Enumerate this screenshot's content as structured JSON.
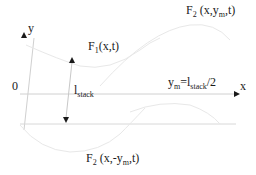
{
  "diagram": {
    "axes": {
      "x_label": "x",
      "y_label": "y",
      "origin_label": "0"
    },
    "curves": [
      {
        "id": "F1",
        "label_main": "F",
        "label_sub": "1",
        "label_args": "(x,t)"
      },
      {
        "id": "F2_upper",
        "label_main": "F",
        "label_sub": "2",
        "label_args_pre": " (x,y",
        "label_args_sub": "m",
        "label_args_post": ",t)"
      },
      {
        "id": "F2_lower",
        "label_main": "F",
        "label_sub": "2",
        "label_args_pre": " (x,-y",
        "label_args_sub": "m",
        "label_args_post": ",t)"
      }
    ],
    "dimension": {
      "label_main": "l",
      "label_sub": "stack"
    },
    "equation": {
      "lhs_main": "y",
      "lhs_sub": "m",
      "eq": "=l",
      "rhs_sub": "stack",
      "rhs_post": "/2"
    },
    "colors": {
      "axis": "#cfcfcf",
      "curve": "#e6e6e6",
      "arrow": "#1a1a1a",
      "text": "#1a1a1a"
    }
  }
}
